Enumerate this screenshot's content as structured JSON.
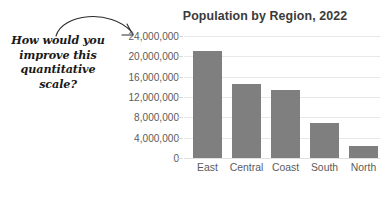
{
  "annotation": {
    "lines": [
      "How would you",
      "improve this",
      "quantitative",
      "scale?"
    ],
    "arrow_icon": "curved-arrow-icon",
    "color": "#1a1a1a"
  },
  "chart_data": {
    "type": "bar",
    "title": "Population by Region, 2022",
    "xlabel": "",
    "ylabel": "",
    "categories": [
      "East",
      "Central",
      "Coast",
      "South",
      "North"
    ],
    "values": [
      21000000,
      14500000,
      13400000,
      6900000,
      2400000
    ],
    "ytick_labels": [
      "0",
      "4,000,000",
      "8,000,000",
      "12,000,000",
      "16,000,000",
      "20,000,000",
      "24,000,000"
    ],
    "ytick_values": [
      0,
      4000000,
      8000000,
      12000000,
      16000000,
      20000000,
      24000000
    ],
    "ylim": [
      0,
      24000000
    ],
    "grid": true,
    "legend": false,
    "bar_color": "#7f7f7f",
    "grid_color": "#e8e8e8",
    "tick_label_color": "#5b5b5b",
    "title_color": "#3a3a3a"
  }
}
